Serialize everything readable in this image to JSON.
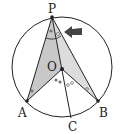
{
  "diagram": {
    "colors": {
      "stroke": "#222222",
      "fill_left": "#c8c8c8",
      "fill_right": "#dcdcdc",
      "arrow": "#444444",
      "marks": "#777777"
    },
    "circle": {
      "cx": 62,
      "cy": 67,
      "r": 50
    },
    "points": {
      "P": {
        "label": "P",
        "x": 52,
        "y": 17
      },
      "O": {
        "label": "O",
        "x": 62,
        "y": 69
      },
      "A": {
        "label": "A",
        "x": 27,
        "y": 101
      },
      "B": {
        "label": "B",
        "x": 98,
        "y": 101
      },
      "C": {
        "label": "C",
        "x": 71,
        "y": 118
      }
    },
    "labels": {
      "P": "P",
      "O": "O",
      "A": "A",
      "B": "B",
      "C": "C"
    },
    "angle_marks": {
      "single_dot": "•",
      "double_dot": "••",
      "single_circle": "∘",
      "double_circle": "∘∘"
    },
    "arrow": {
      "pointing_to": "angle APB (right part)",
      "direction": "left"
    }
  }
}
